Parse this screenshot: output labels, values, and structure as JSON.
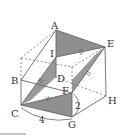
{
  "diagram": {
    "type": "cube-cross-section",
    "colors": {
      "stroke": "#666666",
      "shade": "#8f8f8f",
      "background": "#ffffff"
    },
    "vertices": {
      "A": "A",
      "B": "B",
      "C": "C",
      "D": "D",
      "E": "E",
      "F": "F",
      "G": "G",
      "H": "H",
      "I": "I"
    },
    "measurements": {
      "CG": "4",
      "FG": "2"
    },
    "tick_mark": "="
  }
}
